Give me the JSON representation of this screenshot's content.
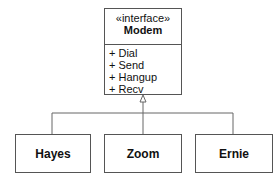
{
  "interface": {
    "stereotype": "«interface»",
    "name": "Modem",
    "operations": [
      "+ Dial",
      "+ Send",
      "+ Hangup",
      "+ Recv"
    ]
  },
  "implementations": [
    {
      "name": "Hayes"
    },
    {
      "name": "Zoom"
    },
    {
      "name": "Ernie"
    }
  ],
  "relationship": "realization"
}
